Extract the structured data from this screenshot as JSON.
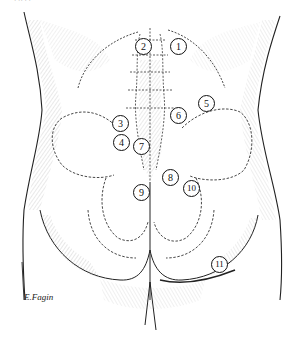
{
  "figure": {
    "top_fragment": "· ·· ·  ·",
    "signature": "E.Fagin",
    "colors": {
      "ink": "#111111",
      "hatch": "#555555",
      "background": "#ffffff"
    },
    "markers": [
      {
        "label": "1",
        "x": 178,
        "y": 46
      },
      {
        "label": "2",
        "x": 143,
        "y": 46
      },
      {
        "label": "3",
        "x": 120,
        "y": 123
      },
      {
        "label": "4",
        "x": 121,
        "y": 142
      },
      {
        "label": "5",
        "x": 206,
        "y": 103
      },
      {
        "label": "6",
        "x": 178,
        "y": 115
      },
      {
        "label": "7",
        "x": 141,
        "y": 146
      },
      {
        "label": "8",
        "x": 170,
        "y": 177
      },
      {
        "label": "9",
        "x": 141,
        "y": 192
      },
      {
        "label": "10",
        "x": 191,
        "y": 188
      },
      {
        "label": "11",
        "x": 219,
        "y": 264
      }
    ]
  }
}
